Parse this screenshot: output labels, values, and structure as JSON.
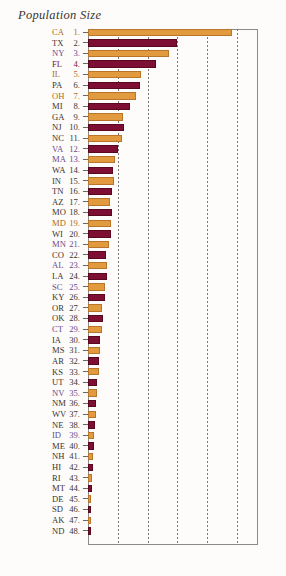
{
  "chart_data": {
    "type": "bar",
    "title": "Population Size",
    "orientation": "horizontal",
    "xlabel": "",
    "ylabel": "",
    "xlim": [
      0,
      40
    ],
    "grid": true,
    "gridlines_x": [
      7,
      14,
      21,
      28,
      35
    ],
    "legend": "none",
    "series_colors": {
      "orange": "#e19a3d",
      "maroon": "#7d0e34"
    },
    "label_colors": {
      "orange": "#b06a18",
      "maroon": "#7d1038",
      "purple": "#6b4a8f",
      "dark": "#3a3430"
    },
    "categories": [
      "CA",
      "TX",
      "NY",
      "FL",
      "IL",
      "PA",
      "OH",
      "MI",
      "GA",
      "NJ",
      "NC",
      "VA",
      "MA",
      "WA",
      "IN",
      "TN",
      "MO",
      "MD",
      "WI",
      "MN",
      "CO",
      "AL",
      "LA",
      "SC",
      "KY",
      "OR",
      "OK",
      "CT",
      "IA",
      "MS",
      "AR",
      "KS",
      "UT",
      "NV",
      "NM",
      "WV",
      "NE",
      "ID",
      "ME",
      "NH",
      "HI",
      "RI",
      "MT",
      "DE",
      "SD",
      "AK",
      "ND"
    ],
    "values": [
      33.9,
      20.9,
      19.0,
      16.0,
      12.4,
      12.3,
      11.4,
      9.9,
      8.2,
      8.4,
      8.0,
      7.1,
      6.3,
      5.9,
      6.1,
      5.7,
      5.6,
      5.3,
      5.4,
      4.9,
      4.3,
      4.4,
      4.5,
      4.0,
      4.0,
      3.4,
      3.5,
      3.4,
      2.9,
      2.8,
      2.7,
      2.7,
      2.2,
      2.0,
      1.8,
      1.8,
      1.7,
      1.3,
      1.3,
      1.2,
      1.2,
      1.0,
      0.9,
      0.8,
      0.75,
      0.63,
      0.64
    ],
    "rows": [
      {
        "rank": "1.",
        "label": "CA",
        "value": 33.9,
        "color": "orange",
        "label_color": "orange"
      },
      {
        "rank": "2.",
        "label": "TX",
        "value": 20.9,
        "color": "maroon",
        "label_color": "dark"
      },
      {
        "rank": "3.",
        "label": "NY",
        "value": 19.0,
        "color": "orange",
        "label_color": "purple"
      },
      {
        "rank": "4.",
        "label": "FL",
        "value": 16.0,
        "color": "maroon",
        "label_color": "maroon"
      },
      {
        "rank": "5.",
        "label": "IL",
        "value": 12.4,
        "color": "orange",
        "label_color": "orange"
      },
      {
        "rank": "6.",
        "label": "PA",
        "value": 12.3,
        "color": "maroon",
        "label_color": "dark"
      },
      {
        "rank": "7.",
        "label": "OH",
        "value": 11.4,
        "color": "orange",
        "label_color": "orange"
      },
      {
        "rank": "8.",
        "label": "MI",
        "value": 9.9,
        "color": "maroon",
        "label_color": "dark"
      },
      {
        "rank": "9.",
        "label": "GA",
        "value": 8.2,
        "color": "orange",
        "label_color": "dark"
      },
      {
        "rank": "10.",
        "label": "NJ",
        "value": 8.4,
        "color": "maroon",
        "label_color": "dark"
      },
      {
        "rank": "11.",
        "label": "NC",
        "value": 8.0,
        "color": "orange",
        "label_color": "dark"
      },
      {
        "rank": "12.",
        "label": "VA",
        "value": 7.1,
        "color": "maroon",
        "label_color": "purple"
      },
      {
        "rank": "13.",
        "label": "MA",
        "value": 6.3,
        "color": "orange",
        "label_color": "purple"
      },
      {
        "rank": "14.",
        "label": "WA",
        "value": 5.9,
        "color": "maroon",
        "label_color": "dark"
      },
      {
        "rank": "15.",
        "label": "IN",
        "value": 6.1,
        "color": "orange",
        "label_color": "dark"
      },
      {
        "rank": "16.",
        "label": "TN",
        "value": 5.7,
        "color": "maroon",
        "label_color": "dark"
      },
      {
        "rank": "17.",
        "label": "AZ",
        "value": 5.1,
        "color": "orange",
        "label_color": "dark"
      },
      {
        "rank": "18.",
        "label": "MO",
        "value": 5.6,
        "color": "maroon",
        "label_color": "dark"
      },
      {
        "rank": "19.",
        "label": "MD",
        "value": 5.3,
        "color": "orange",
        "label_color": "orange"
      },
      {
        "rank": "20.",
        "label": "WI",
        "value": 5.4,
        "color": "maroon",
        "label_color": "dark"
      },
      {
        "rank": "21.",
        "label": "MN",
        "value": 4.9,
        "color": "orange",
        "label_color": "purple"
      },
      {
        "rank": "22.",
        "label": "CO",
        "value": 4.3,
        "color": "maroon",
        "label_color": "dark"
      },
      {
        "rank": "23.",
        "label": "AL",
        "value": 4.4,
        "color": "orange",
        "label_color": "purple"
      },
      {
        "rank": "24.",
        "label": "LA",
        "value": 4.5,
        "color": "maroon",
        "label_color": "dark"
      },
      {
        "rank": "25.",
        "label": "SC",
        "value": 4.0,
        "color": "orange",
        "label_color": "purple"
      },
      {
        "rank": "26.",
        "label": "KY",
        "value": 4.0,
        "color": "maroon",
        "label_color": "dark"
      },
      {
        "rank": "27.",
        "label": "OR",
        "value": 3.4,
        "color": "orange",
        "label_color": "dark"
      },
      {
        "rank": "28.",
        "label": "OK",
        "value": 3.5,
        "color": "maroon",
        "label_color": "dark"
      },
      {
        "rank": "29.",
        "label": "CT",
        "value": 3.4,
        "color": "orange",
        "label_color": "purple"
      },
      {
        "rank": "30.",
        "label": "IA",
        "value": 2.9,
        "color": "maroon",
        "label_color": "dark"
      },
      {
        "rank": "31.",
        "label": "MS",
        "value": 2.8,
        "color": "orange",
        "label_color": "dark"
      },
      {
        "rank": "32.",
        "label": "AR",
        "value": 2.7,
        "color": "maroon",
        "label_color": "dark"
      },
      {
        "rank": "33.",
        "label": "KS",
        "value": 2.7,
        "color": "orange",
        "label_color": "dark"
      },
      {
        "rank": "34.",
        "label": "UT",
        "value": 2.2,
        "color": "maroon",
        "label_color": "dark"
      },
      {
        "rank": "35.",
        "label": "NV",
        "value": 2.0,
        "color": "orange",
        "label_color": "purple"
      },
      {
        "rank": "36.",
        "label": "NM",
        "value": 1.8,
        "color": "maroon",
        "label_color": "dark"
      },
      {
        "rank": "37.",
        "label": "WV",
        "value": 1.8,
        "color": "orange",
        "label_color": "dark"
      },
      {
        "rank": "38.",
        "label": "NE",
        "value": 1.7,
        "color": "maroon",
        "label_color": "dark"
      },
      {
        "rank": "39.",
        "label": "ID",
        "value": 1.3,
        "color": "orange",
        "label_color": "purple"
      },
      {
        "rank": "40.",
        "label": "ME",
        "value": 1.3,
        "color": "maroon",
        "label_color": "dark"
      },
      {
        "rank": "41.",
        "label": "NH",
        "value": 1.2,
        "color": "orange",
        "label_color": "dark"
      },
      {
        "rank": "42.",
        "label": "HI",
        "value": 1.2,
        "color": "maroon",
        "label_color": "dark"
      },
      {
        "rank": "43.",
        "label": "RI",
        "value": 1.0,
        "color": "orange",
        "label_color": "dark"
      },
      {
        "rank": "44.",
        "label": "MT",
        "value": 0.9,
        "color": "maroon",
        "label_color": "dark"
      },
      {
        "rank": "45.",
        "label": "DE",
        "value": 0.8,
        "color": "orange",
        "label_color": "dark"
      },
      {
        "rank": "46.",
        "label": "SD",
        "value": 0.75,
        "color": "maroon",
        "label_color": "dark"
      },
      {
        "rank": "47.",
        "label": "AK",
        "value": 0.63,
        "color": "orange",
        "label_color": "dark"
      },
      {
        "rank": "48.",
        "label": "ND",
        "value": 0.64,
        "color": "maroon",
        "label_color": "dark"
      }
    ]
  }
}
